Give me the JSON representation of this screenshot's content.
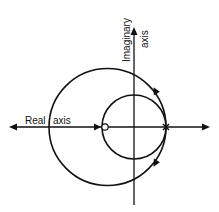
{
  "diagram": {
    "type": "root-locus",
    "labels": {
      "real_axis_word1": "Real",
      "real_axis_word2": "axis",
      "imag_axis_word1": "Imaginary",
      "imag_axis_word2": "axis"
    },
    "markers": {
      "zero": "o",
      "pole": "x"
    },
    "colors": {
      "stroke": "#111111",
      "background": "#ffffff"
    }
  }
}
